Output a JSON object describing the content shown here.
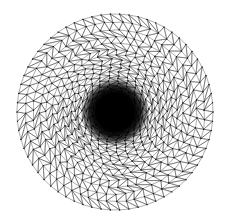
{
  "figure": {
    "kind": "finite-element-mesh",
    "background_color": "#ffffff",
    "canvas": {
      "width": 225,
      "height": 219
    }
  },
  "mesh": {
    "domain_shape": "disk",
    "center_x": 115,
    "center_y": 112,
    "radius": 98,
    "element_type": "triangle",
    "topology": "concentric-radial-rings",
    "edge_color": "#3a3a3a",
    "node_color": "#101010",
    "edge_width": 0.42,
    "node_radius": 0.62,
    "ring_count": 58,
    "base_segments": 66,
    "grading": "geometric-refinement-toward-center",
    "grading_ratio": 0.915,
    "min_ring_radius": 0.6,
    "core_radius": 22,
    "core_color": "#000000",
    "core_appearance": "unresolved-black-blob",
    "outer_element_size": 9.5,
    "jitter_amplitude": 0.16
  },
  "labels": {
    "caption": "",
    "axis_x": "",
    "axis_y": ""
  }
}
